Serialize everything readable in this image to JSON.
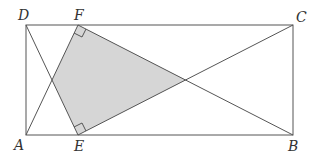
{
  "diagram": {
    "type": "geometry",
    "shape": "rectangle ABCD with points E on AB and F on DC",
    "colors": {
      "stroke": "#555555",
      "fill": "#d6d6d6",
      "label": "#333333"
    },
    "points": {
      "A": {
        "label": "A",
        "x": 26,
        "y": 135
      },
      "B": {
        "label": "B",
        "x": 293,
        "y": 135
      },
      "C": {
        "label": "C",
        "x": 293,
        "y": 25
      },
      "D": {
        "label": "D",
        "x": 26,
        "y": 25
      },
      "E": {
        "label": "E",
        "x": 78,
        "y": 135
      },
      "F": {
        "label": "F",
        "x": 78,
        "y": 25
      },
      "X": {
        "x": 52,
        "y": 80
      }
    },
    "segments": [
      [
        "A",
        "B"
      ],
      [
        "B",
        "C"
      ],
      [
        "C",
        "D"
      ],
      [
        "D",
        "A"
      ],
      [
        "D",
        "E"
      ],
      [
        "A",
        "F"
      ],
      [
        "F",
        "B"
      ],
      [
        "E",
        "C"
      ]
    ],
    "shaded_region": [
      "F",
      "X",
      "E",
      "Y"
    ],
    "right_angle_markers": [
      "F",
      "E"
    ],
    "labels": {
      "A": "A",
      "B": "B",
      "C": "C",
      "D": "D",
      "E": "E",
      "F": "F"
    }
  }
}
